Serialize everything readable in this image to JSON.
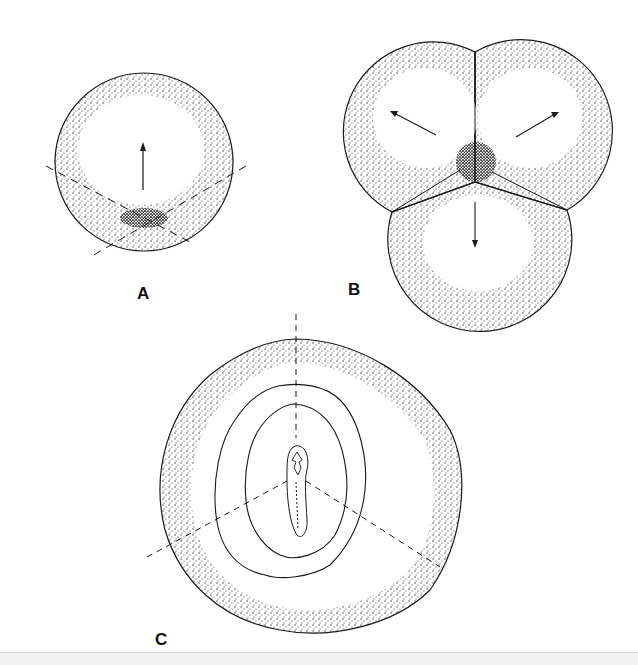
{
  "figure": {
    "panels": [
      {
        "id": "A",
        "label": "A",
        "description": "single cell with dense cap at bottom, upward arrow, dashed cleavage lines"
      },
      {
        "id": "B",
        "label": "B",
        "description": "three-cell cluster with dense central region and outward arrows"
      },
      {
        "id": "C",
        "label": "C",
        "description": "irregular rounded outline with concentric contours and central elongated structure, dashed axes"
      }
    ]
  },
  "colors": {
    "ink": "#1a1a1a",
    "stipple": "#333333",
    "background": "#ffffff"
  }
}
